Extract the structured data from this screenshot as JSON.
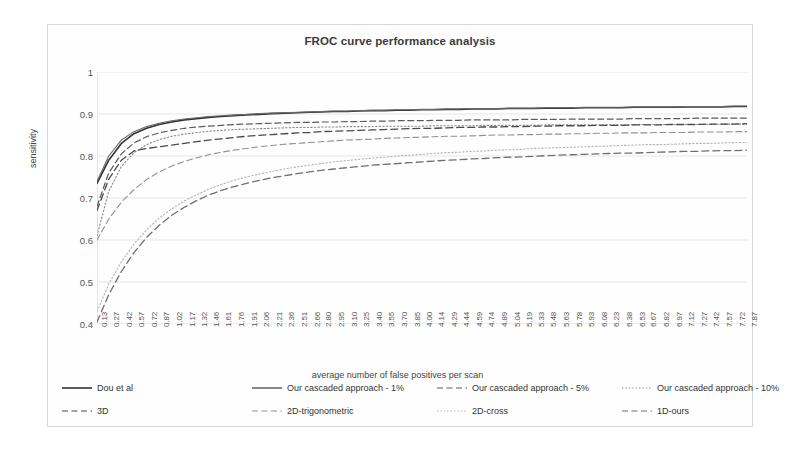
{
  "chart_data": {
    "type": "line",
    "title": "FROC curve performance analysis",
    "xlabel": "average number of false positives per scan",
    "ylabel": "sensitivity",
    "ylim": [
      0.4,
      1.0
    ],
    "yticks": [
      "1",
      "0.9",
      "0.8",
      "0.7",
      "0.6",
      "0.5",
      "0.4"
    ],
    "ytick_values": [
      1,
      0.9,
      0.8,
      0.7,
      0.6,
      0.5,
      0.4
    ],
    "grid": true,
    "legend_position": "bottom",
    "x": [
      0.13,
      0.27,
      0.42,
      0.57,
      0.72,
      0.87,
      1.02,
      1.17,
      1.32,
      1.46,
      1.61,
      1.76,
      1.91,
      2.06,
      2.21,
      2.36,
      2.51,
      2.66,
      2.8,
      2.95,
      3.1,
      3.25,
      3.4,
      3.55,
      3.7,
      3.85,
      4.0,
      4.14,
      4.29,
      4.44,
      4.59,
      4.74,
      4.89,
      5.04,
      5.19,
      5.33,
      5.48,
      5.63,
      5.78,
      5.93,
      6.08,
      6.23,
      6.38,
      6.53,
      6.67,
      6.82,
      6.97,
      7.12,
      7.27,
      7.42,
      7.57,
      7.72,
      7.87
    ],
    "xticks": [
      "0.13",
      "0.27",
      "0.42",
      "0.57",
      "0.72",
      "0.87",
      "1.02",
      "1.17",
      "1.32",
      "1.46",
      "1.61",
      "1.76",
      "1.91",
      "2.06",
      "2.21",
      "2.36",
      "2.51",
      "2.66",
      "2.80",
      "2.95",
      "3.10",
      "3.25",
      "3.40",
      "3.55",
      "3.70",
      "3.85",
      "4.00",
      "4.14",
      "4.29",
      "4.44",
      "4.59",
      "4.74",
      "4.89",
      "5.04",
      "5.19",
      "5.33",
      "5.48",
      "5.63",
      "5.78",
      "5.93",
      "6.08",
      "6.23",
      "6.38",
      "6.53",
      "6.67",
      "6.82",
      "6.97",
      "7.12",
      "7.27",
      "7.42",
      "7.57",
      "7.72",
      "7.87"
    ],
    "series": [
      {
        "name": "Dou et al",
        "style": "solid",
        "color": "#333333",
        "width": 1.6,
        "values": [
          0.735,
          0.79,
          0.83,
          0.853,
          0.866,
          0.875,
          0.881,
          0.886,
          0.889,
          0.892,
          0.894,
          0.896,
          0.898,
          0.899,
          0.901,
          0.902,
          0.903,
          0.904,
          0.905,
          0.906,
          0.906,
          0.907,
          0.908,
          0.908,
          0.909,
          0.909,
          0.91,
          0.91,
          0.911,
          0.911,
          0.912,
          0.912,
          0.912,
          0.913,
          0.913,
          0.913,
          0.914,
          0.914,
          0.914,
          0.915,
          0.915,
          0.915,
          0.915,
          0.916,
          0.916,
          0.916,
          0.916,
          0.917,
          0.917,
          0.917,
          0.917,
          0.918,
          0.918
        ]
      },
      {
        "name": "Our cascaded approach - 1%",
        "style": "solid",
        "color": "#6b6b6b",
        "width": 1.1,
        "values": [
          0.74,
          0.8,
          0.838,
          0.858,
          0.87,
          0.878,
          0.884,
          0.888,
          0.891,
          0.894,
          0.896,
          0.898,
          0.899,
          0.901,
          0.902,
          0.903,
          0.904,
          0.905,
          0.906,
          0.907,
          0.907,
          0.908,
          0.909,
          0.909,
          0.91,
          0.91,
          0.911,
          0.911,
          0.912,
          0.912,
          0.913,
          0.913,
          0.913,
          0.914,
          0.914,
          0.914,
          0.915,
          0.915,
          0.915,
          0.916,
          0.916,
          0.916,
          0.916,
          0.917,
          0.917,
          0.917,
          0.917,
          0.918,
          0.918,
          0.918,
          0.918,
          0.919,
          0.919
        ]
      },
      {
        "name": "Our cascaded approach - 5%",
        "style": "dashed",
        "color": "#5a5a5a",
        "width": 1.2,
        "values": [
          0.68,
          0.76,
          0.805,
          0.831,
          0.846,
          0.855,
          0.861,
          0.866,
          0.869,
          0.871,
          0.873,
          0.875,
          0.876,
          0.877,
          0.878,
          0.879,
          0.88,
          0.88,
          0.881,
          0.881,
          0.882,
          0.882,
          0.883,
          0.883,
          0.884,
          0.884,
          0.884,
          0.885,
          0.885,
          0.885,
          0.886,
          0.886,
          0.886,
          0.886,
          0.887,
          0.887,
          0.887,
          0.887,
          0.888,
          0.888,
          0.888,
          0.888,
          0.888,
          0.889,
          0.889,
          0.889,
          0.889,
          0.889,
          0.89,
          0.89,
          0.89,
          0.89,
          0.89
        ]
      },
      {
        "name": "Our cascaded approach - 10%",
        "style": "dotted",
        "color": "#8a8a8a",
        "width": 1.1,
        "values": [
          0.61,
          0.716,
          0.775,
          0.808,
          0.827,
          0.839,
          0.847,
          0.852,
          0.856,
          0.859,
          0.861,
          0.863,
          0.864,
          0.865,
          0.866,
          0.867,
          0.868,
          0.868,
          0.869,
          0.869,
          0.87,
          0.87,
          0.87,
          0.871,
          0.871,
          0.871,
          0.871,
          0.872,
          0.872,
          0.872,
          0.872,
          0.873,
          0.873,
          0.873,
          0.873,
          0.873,
          0.874,
          0.874,
          0.874,
          0.874,
          0.874,
          0.874,
          0.874,
          0.875,
          0.875,
          0.875,
          0.875,
          0.875,
          0.875,
          0.875,
          0.876,
          0.876,
          0.876
        ]
      },
      {
        "name": "3D",
        "style": "dashed",
        "color": "#4a4a4a",
        "width": 1.3,
        "values": [
          0.67,
          0.745,
          0.79,
          0.812,
          0.818,
          0.822,
          0.826,
          0.83,
          0.834,
          0.838,
          0.841,
          0.844,
          0.847,
          0.849,
          0.851,
          0.853,
          0.855,
          0.856,
          0.858,
          0.859,
          0.86,
          0.861,
          0.862,
          0.863,
          0.864,
          0.865,
          0.866,
          0.866,
          0.867,
          0.868,
          0.868,
          0.869,
          0.869,
          0.87,
          0.87,
          0.871,
          0.871,
          0.872,
          0.872,
          0.872,
          0.873,
          0.873,
          0.873,
          0.874,
          0.874,
          0.874,
          0.875,
          0.875,
          0.875,
          0.876,
          0.876,
          0.876,
          0.877
        ]
      },
      {
        "name": "2D-trigonometric",
        "style": "dashed",
        "color": "#909090",
        "width": 1.1,
        "values": [
          0.6,
          0.65,
          0.69,
          0.72,
          0.744,
          0.762,
          0.776,
          0.787,
          0.796,
          0.803,
          0.809,
          0.814,
          0.818,
          0.822,
          0.825,
          0.828,
          0.83,
          0.832,
          0.834,
          0.836,
          0.838,
          0.839,
          0.84,
          0.842,
          0.843,
          0.844,
          0.845,
          0.846,
          0.847,
          0.847,
          0.848,
          0.849,
          0.85,
          0.85,
          0.851,
          0.851,
          0.852,
          0.852,
          0.853,
          0.853,
          0.854,
          0.854,
          0.855,
          0.855,
          0.855,
          0.856,
          0.856,
          0.856,
          0.857,
          0.857,
          0.857,
          0.858,
          0.858
        ]
      },
      {
        "name": "2D-cross",
        "style": "dotted",
        "color": "#b4b4b4",
        "width": 1.1,
        "values": [
          0.43,
          0.495,
          0.548,
          0.59,
          0.624,
          0.652,
          0.674,
          0.693,
          0.708,
          0.721,
          0.732,
          0.742,
          0.75,
          0.757,
          0.763,
          0.769,
          0.774,
          0.778,
          0.782,
          0.786,
          0.789,
          0.792,
          0.795,
          0.797,
          0.8,
          0.802,
          0.804,
          0.806,
          0.808,
          0.809,
          0.811,
          0.812,
          0.814,
          0.815,
          0.816,
          0.818,
          0.819,
          0.82,
          0.821,
          0.822,
          0.823,
          0.824,
          0.825,
          0.826,
          0.827,
          0.827,
          0.828,
          0.829,
          0.83,
          0.83,
          0.831,
          0.832,
          0.832
        ]
      },
      {
        "name": "1D-ours",
        "style": "dashed",
        "color": "#6f6f6f",
        "width": 1.3,
        "values": [
          0.405,
          0.47,
          0.525,
          0.57,
          0.606,
          0.635,
          0.659,
          0.678,
          0.694,
          0.707,
          0.718,
          0.727,
          0.735,
          0.742,
          0.748,
          0.753,
          0.758,
          0.762,
          0.766,
          0.769,
          0.772,
          0.775,
          0.778,
          0.78,
          0.782,
          0.784,
          0.786,
          0.788,
          0.79,
          0.791,
          0.793,
          0.794,
          0.796,
          0.797,
          0.798,
          0.799,
          0.801,
          0.802,
          0.803,
          0.804,
          0.805,
          0.806,
          0.807,
          0.807,
          0.808,
          0.809,
          0.81,
          0.811,
          0.811,
          0.812,
          0.813,
          0.813,
          0.814
        ]
      }
    ]
  },
  "legend": {
    "row1": [
      {
        "label": "Dou et al",
        "style": "solid",
        "color": "#333333"
      },
      {
        "label": "Our cascaded approach - 1%",
        "style": "solid",
        "color": "#6b6b6b"
      },
      {
        "label": "Our cascaded approach - 5%",
        "style": "dashed",
        "color": "#5a5a5a"
      },
      {
        "label": "Our cascaded approach - 10%",
        "style": "dotted",
        "color": "#8a8a8a"
      }
    ],
    "row2": [
      {
        "label": "3D",
        "style": "dashed",
        "color": "#4a4a4a"
      },
      {
        "label": "2D-trigonometric",
        "style": "dashed",
        "color": "#909090"
      },
      {
        "label": "2D-cross",
        "style": "dotted",
        "color": "#b4b4b4"
      },
      {
        "label": "1D-ours",
        "style": "dashed",
        "color": "#6f6f6f"
      }
    ]
  },
  "colors": {
    "grid": "#dddddd",
    "axis": "#c9c9c9",
    "frame_border": "#d8d8d8",
    "text": "#3a3a3a"
  }
}
